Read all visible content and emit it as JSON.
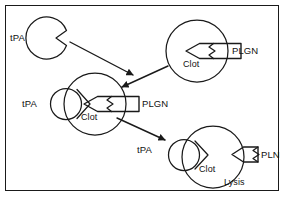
{
  "figure": {
    "border_color": "#1a1a1a",
    "stroke_color": "#1a1a1a",
    "background": "#ffffff",
    "width": 286,
    "height": 198
  },
  "labels": {
    "tpa_free": "tPA",
    "tpa_middle": "tPA",
    "tpa_lower": "tPA",
    "plgn_top": "PLGN",
    "plgn_middle": "PLGN",
    "pln_bottom": "PLN",
    "clot_top": "Clot",
    "clot_middle": "Clot",
    "clot_bottom": "Clot",
    "lysis": "Lysis"
  },
  "nodes": [
    {
      "name": "free-tpa-molecule",
      "type": "pacman",
      "label": "tPA",
      "cx": 48,
      "cy": 38,
      "r": 21
    },
    {
      "name": "top-clot-with-plgn",
      "type": "clot-complex",
      "clot_label": "Clot",
      "token_label": "PLGN",
      "cx": 197,
      "cy": 51,
      "r": 31
    },
    {
      "name": "middle-tpa-clot-plgn",
      "type": "clot-complex",
      "clot_label": "Clot",
      "token_label": "PLGN",
      "tpa_label": "tPA",
      "cx": 95,
      "cy": 104,
      "r": 31
    },
    {
      "name": "bottom-tpa-clot-pln-lysis",
      "type": "clot-complex",
      "clot_label": "Clot",
      "token_label": "PLN",
      "tpa_label": "tPA",
      "status_label": "Lysis",
      "cx": 213,
      "cy": 157,
      "r": 31
    }
  ],
  "arrows": [
    {
      "name": "tpa-to-clot-arrow",
      "from": "free-tpa-molecule",
      "to": "middle-tpa-clot-plgn"
    },
    {
      "name": "plgn-clot-to-complex-arrow",
      "from": "top-clot-with-plgn",
      "to": "middle-tpa-clot-plgn"
    },
    {
      "name": "complex-to-lysis-arrow",
      "from": "middle-tpa-clot-plgn",
      "to": "bottom-tpa-clot-pln-lysis"
    }
  ]
}
